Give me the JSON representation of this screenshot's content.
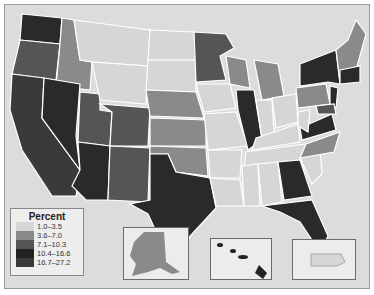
{
  "legend": {
    "title": "Percent",
    "bins": [
      {
        "label": "1.0–3.5",
        "color": "#d6d6d6"
      },
      {
        "label": "3.6–7.0",
        "color": "#8a8a8a"
      },
      {
        "label": "7.1–10.3",
        "color": "#555555"
      },
      {
        "label": "10.4–16.6",
        "color": "#2a2a2a"
      },
      {
        "label": "16.7–27.2",
        "color": "#3a3a3a"
      }
    ]
  },
  "insets": [
    "Alaska",
    "Hawaii",
    "Puerto Rico"
  ]
}
